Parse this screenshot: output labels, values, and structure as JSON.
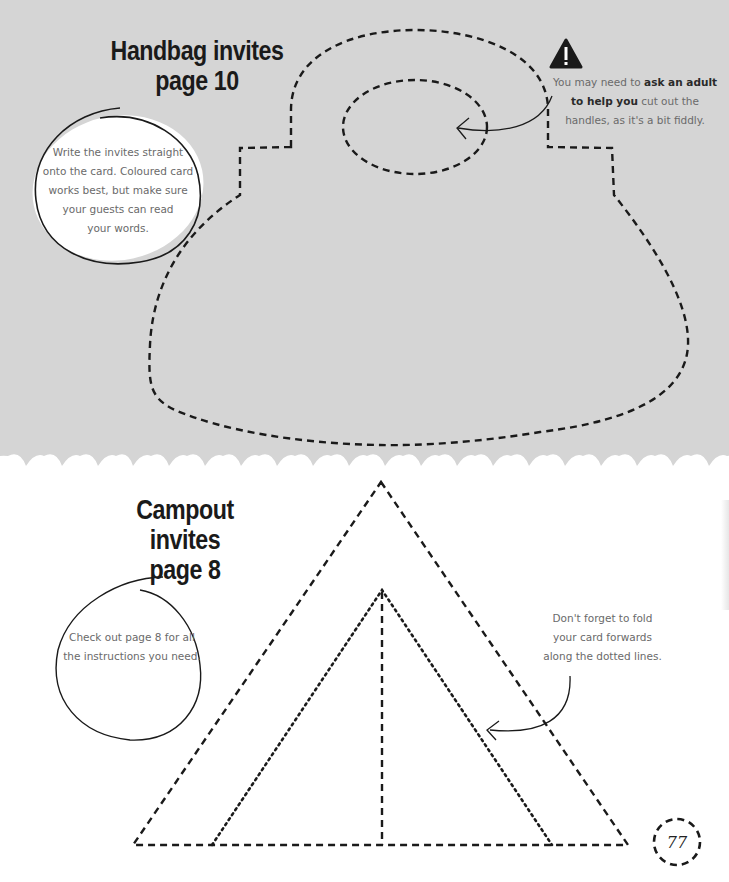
{
  "handbag": {
    "title_line1": "Handbag invites",
    "title_line2": "page 10",
    "bubble": {
      "line1": "Write the invites straight",
      "line2": "onto the card. Coloured card",
      "line3": "works best, but make sure",
      "line4": "your guests can read",
      "line5": "your words."
    },
    "warning": {
      "icon": "warning-triangle-icon",
      "pre": "You may need to ",
      "bold1": "ask an adult",
      "bold2": "to help you",
      "post1": " cut out the",
      "line3": "handles, as it's a bit fiddly."
    }
  },
  "campout": {
    "title_line1": "Campout invites",
    "title_line2": "page 8",
    "bubble": {
      "line1": "Check out page 8 for all",
      "line2": "the instructions you need."
    },
    "note": {
      "line1": "Don't forget to fold",
      "line2": "your card forwards",
      "line3": "along the dotted lines."
    }
  },
  "page_number": "77",
  "colors": {
    "top_background": "#d5d5d5",
    "bottom_background": "#ffffff",
    "line_color": "#1a1a1a"
  }
}
